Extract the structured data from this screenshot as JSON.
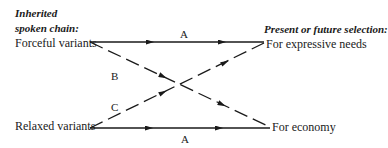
{
  "left_header": {
    "line1": "Inherited",
    "line2": "spoken chain:"
  },
  "right_header": "Present or future selection:",
  "nodes": {
    "forceful": "Forceful variants",
    "relaxed": "Relaxed variants",
    "expressive": "For expressive needs",
    "economy": "For economy"
  },
  "edges": {
    "top_a": "A",
    "b": "B",
    "c": "C",
    "bottom_a": "A"
  },
  "colors": {
    "ink": "#1a1a1a",
    "background": "#ffffff"
  }
}
